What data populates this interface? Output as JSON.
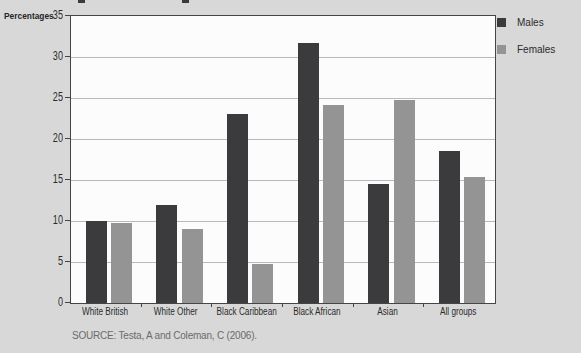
{
  "page": {
    "background_color": "#d8d8d8",
    "plot_background_color": "#fcfcfc",
    "plot_border_color": "#454545",
    "gridline_color": "#b9b9b9"
  },
  "chart_data": {
    "type": "bar",
    "title": "",
    "ylabel": "Percentages",
    "xlabel": "",
    "categories": [
      "White British",
      "White Other",
      "Black Caribbean",
      "Black African",
      "Asian",
      "All groups"
    ],
    "series": [
      {
        "name": "Males",
        "color": "#3b3b3d",
        "values": [
          10,
          12,
          23,
          31.7,
          14.5,
          18.5
        ]
      },
      {
        "name": "Females",
        "color": "#949494",
        "values": [
          9.7,
          9,
          4.7,
          24.2,
          24.8,
          15.4
        ]
      }
    ],
    "ylim": [
      0,
      35
    ],
    "yticks": [
      0,
      5,
      10,
      15,
      20,
      25,
      30,
      35
    ],
    "grid": true,
    "legend_position": "top-right-outside"
  },
  "source": {
    "text": "SOURCE: Testa, A and Coleman, C (2006)."
  }
}
